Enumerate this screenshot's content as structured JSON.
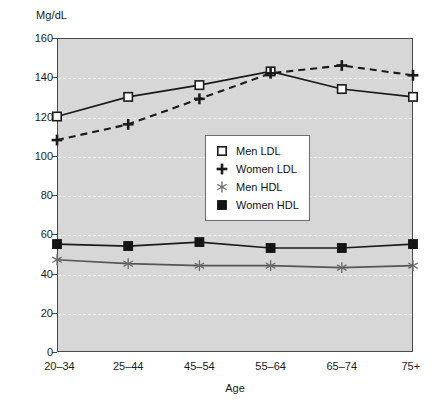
{
  "chart_data": {
    "type": "line",
    "title": "",
    "ylabel": "Mg/dL",
    "xlabel": "Age",
    "categories": [
      "20–34",
      "25–44",
      "45–54",
      "55–64",
      "65–74",
      "75+"
    ],
    "ylim": [
      0,
      160
    ],
    "ytick_values": [
      0,
      20,
      40,
      60,
      80,
      100,
      120,
      140,
      160
    ],
    "ytick_labels": [
      "0",
      "20",
      "40",
      "60",
      "80",
      "100",
      "120",
      "140",
      "160"
    ],
    "grid": true,
    "grid_axis": "y",
    "legend_position": "center",
    "plot_background": "#d7d7d7",
    "series": [
      {
        "name": "Men LDL",
        "marker": "open-square",
        "linestyle": "solid",
        "color": "#1a1a1a",
        "values": [
          120,
          130,
          136,
          143,
          134,
          130
        ]
      },
      {
        "name": "Women LDL",
        "marker": "plus",
        "linestyle": "dashed",
        "color": "#1a1a1a",
        "values": [
          108,
          116,
          129,
          142,
          146,
          141
        ]
      },
      {
        "name": "Men HDL",
        "marker": "asterisk",
        "linestyle": "solid",
        "color": "#555555",
        "values": [
          47,
          45,
          44,
          44,
          43,
          44
        ]
      },
      {
        "name": "Women HDL",
        "marker": "filled-square",
        "linestyle": "solid",
        "color": "#1a1a1a",
        "values": [
          55,
          54,
          56,
          53,
          53,
          55
        ]
      }
    ]
  },
  "legend": {
    "items": [
      {
        "label": "Men LDL",
        "glyph": "open-square-icon"
      },
      {
        "label": "Women LDL",
        "glyph": "plus-icon"
      },
      {
        "label": "Men HDL",
        "glyph": "asterisk-icon"
      },
      {
        "label": "Women HDL",
        "glyph": "filled-square-icon"
      }
    ]
  }
}
